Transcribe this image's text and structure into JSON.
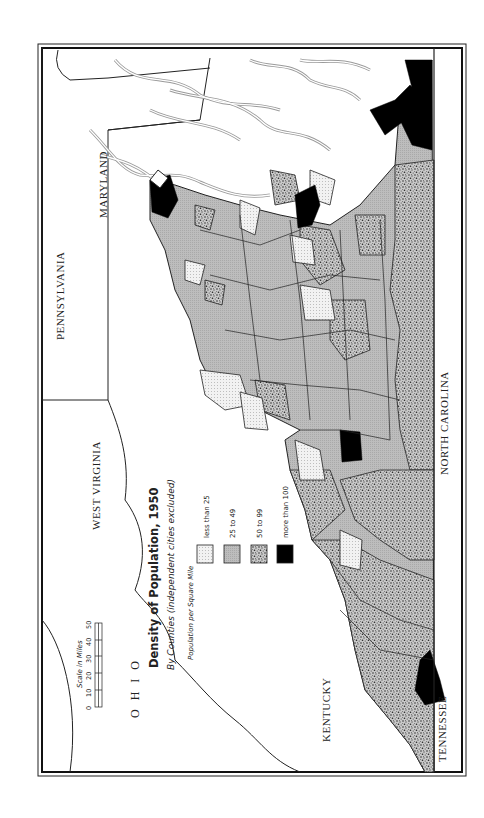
{
  "map": {
    "title": "Density of Population, 1950",
    "subtitle": "By Counties (independent cities excluded)",
    "orientation": "rotated 90° counter-clockwise"
  },
  "legend": {
    "heading": "Population per Square Mile",
    "items": [
      {
        "label": "less than 25",
        "pattern": "fine-dots",
        "color": "#ececec"
      },
      {
        "label": "25 to 49",
        "pattern": "gray",
        "color": "#b8b8b8"
      },
      {
        "label": "50 to 99",
        "pattern": "stipple",
        "color": "#8a8a8a"
      },
      {
        "label": "more than 100",
        "pattern": "solid",
        "color": "#000000"
      }
    ]
  },
  "scale": {
    "title": "Scale in Miles",
    "ticks": [
      "0",
      "10",
      "20",
      "30",
      "40",
      "50"
    ]
  },
  "states": {
    "pennsylvania": "PENNSYLVANIA",
    "maryland": "MARYLAND",
    "west_virginia": "WEST VIRGINIA",
    "ohio": "OHIO",
    "kentucky": "KENTUCKY",
    "north_carolina": "NORTH CAROLINA",
    "tennessee": "TENNESSEE"
  }
}
